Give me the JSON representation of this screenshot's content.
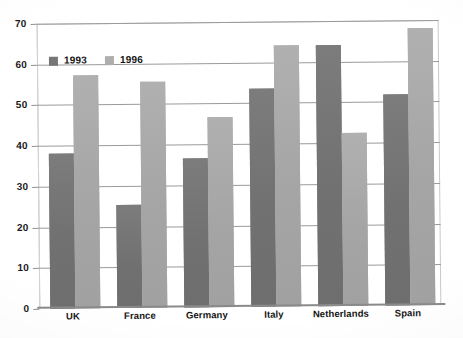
{
  "chart_data": {
    "type": "bar",
    "title": "",
    "subtitle": "",
    "xlabel": "",
    "ylabel": "",
    "ylim": [
      0,
      70
    ],
    "yticks": [
      0,
      10,
      20,
      30,
      40,
      50,
      60,
      70
    ],
    "grid": true,
    "legend_position": "top-left inside plot",
    "categories": [
      "UK",
      "France",
      "Germany",
      "Italy",
      "Netherlands",
      "Spain"
    ],
    "series": [
      {
        "name": "1993",
        "color": "#767676",
        "values": [
          38,
          25.2,
          36.5,
          53.5,
          64,
          51.8
        ]
      },
      {
        "name": "1996",
        "color": "#a9a9a9",
        "values": [
          57.2,
          55.4,
          46.6,
          64,
          42.6,
          68
        ]
      }
    ]
  },
  "legend": {
    "items": [
      {
        "label": "1993",
        "swatch": "legend-swatch-1993"
      },
      {
        "label": "1996",
        "swatch": "legend-swatch-1996"
      }
    ]
  },
  "axes": {
    "y": {
      "ticks": [
        "0",
        "10",
        "20",
        "30",
        "40",
        "50",
        "60",
        "70"
      ]
    },
    "x": {
      "ticks": [
        "UK",
        "France",
        "Germany",
        "Italy",
        "Netherlands",
        "Spain"
      ]
    }
  },
  "colors": {
    "series_1993": "#767676",
    "series_1996": "#a9a9a9",
    "gridline": "#9a9a9a",
    "axis": "#8a8a8a",
    "text": "#141414",
    "background": "#ffffff"
  }
}
